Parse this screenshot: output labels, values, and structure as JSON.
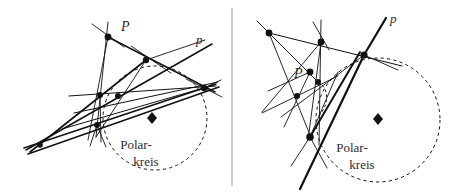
{
  "figure": {
    "background_color": "#ffffff",
    "ink_color": "#111111",
    "text_color": "#2b2b2b",
    "divider_color": "#b4b4b4",
    "width": 457,
    "height": 194,
    "divider": {
      "x": 232,
      "y1": 8,
      "y2": 186
    }
  },
  "panels": [
    {
      "id": "left",
      "name": "left-panel",
      "point_label": "P",
      "line_label": "p",
      "circle_label_line1": "Polar-",
      "circle_label_line2": "kreis",
      "circle": {
        "cx": 155,
        "cy": 118,
        "r": 52,
        "style": "dashed"
      },
      "center_marker": {
        "x": 152,
        "y": 118,
        "shape": "diamond"
      },
      "point_label_pos": {
        "x": 121,
        "y": 31
      },
      "line_label_pos": {
        "x": 196,
        "y": 44
      },
      "circle_label_pos": {
        "x": 136,
        "y": 149
      },
      "nodes": [
        {
          "x": 108,
          "y": 37,
          "r": 3.4
        },
        {
          "x": 146,
          "y": 60,
          "r": 3.2
        },
        {
          "x": 100,
          "y": 95,
          "r": 3.0
        },
        {
          "x": 118,
          "y": 96,
          "r": 3.0
        },
        {
          "x": 97,
          "y": 125,
          "r": 3.0
        },
        {
          "x": 40,
          "y": 145,
          "r": 2.8
        },
        {
          "x": 204,
          "y": 88,
          "r": 3.2
        }
      ],
      "segments": [
        {
          "x1": 92,
          "y1": 24,
          "x2": 124,
          "y2": 47,
          "w": 0.9
        },
        {
          "x1": 108,
          "y1": 22,
          "x2": 96,
          "y2": 137,
          "w": 0.9
        },
        {
          "x1": 108,
          "y1": 37,
          "x2": 215,
          "y2": 92,
          "w": 1.5
        },
        {
          "x1": 108,
          "y1": 37,
          "x2": 88,
          "y2": 140,
          "w": 0.9
        },
        {
          "x1": 131,
          "y1": 46,
          "x2": 171,
          "y2": 73,
          "w": 0.9
        },
        {
          "x1": 146,
          "y1": 60,
          "x2": 205,
          "y2": 40,
          "w": 0.9
        },
        {
          "x1": 146,
          "y1": 60,
          "x2": 30,
          "y2": 152,
          "w": 1.6
        },
        {
          "x1": 146,
          "y1": 60,
          "x2": 96,
          "y2": 137,
          "w": 0.9
        },
        {
          "x1": 26,
          "y1": 150,
          "x2": 212,
          "y2": 44,
          "w": 1.5
        },
        {
          "x1": 24,
          "y1": 148,
          "x2": 216,
          "y2": 84,
          "w": 1.5
        },
        {
          "x1": 28,
          "y1": 154,
          "x2": 219,
          "y2": 87,
          "w": 1.5
        },
        {
          "x1": 69,
          "y1": 96,
          "x2": 216,
          "y2": 86,
          "w": 1.0
        },
        {
          "x1": 74,
          "y1": 113,
          "x2": 218,
          "y2": 82,
          "w": 1.0
        },
        {
          "x1": 62,
          "y1": 129,
          "x2": 214,
          "y2": 85,
          "w": 1.0
        },
        {
          "x1": 204,
          "y1": 88,
          "x2": 186,
          "y2": 79,
          "w": 0.9
        },
        {
          "x1": 204,
          "y1": 88,
          "x2": 221,
          "y2": 80,
          "w": 0.9
        },
        {
          "x1": 204,
          "y1": 88,
          "x2": 222,
          "y2": 97,
          "w": 0.9
        },
        {
          "x1": 97,
          "y1": 125,
          "x2": 106,
          "y2": 147,
          "w": 0.9
        },
        {
          "x1": 97,
          "y1": 125,
          "x2": 90,
          "y2": 146,
          "w": 0.9
        },
        {
          "x1": 100,
          "y1": 95,
          "x2": 101,
          "y2": 142,
          "w": 0.9
        }
      ]
    },
    {
      "id": "right",
      "name": "right-panel",
      "point_label": "P",
      "line_label": "p",
      "circle_label_line1": "Polar-",
      "circle_label_line2": "kreis",
      "circle": {
        "cx": 378,
        "cy": 120,
        "r": 62,
        "style": "dashed"
      },
      "center_marker": {
        "x": 378,
        "y": 119,
        "shape": "diamond"
      },
      "point_label_pos": {
        "x": 294,
        "y": 78
      },
      "line_label_pos": {
        "x": 390,
        "y": 23
      },
      "circle_label_pos": {
        "x": 352,
        "y": 152
      },
      "nodes": [
        {
          "x": 269,
          "y": 33,
          "r": 3.4
        },
        {
          "x": 321,
          "y": 42,
          "r": 3.4
        },
        {
          "x": 364,
          "y": 55,
          "r": 3.6
        },
        {
          "x": 310,
          "y": 72,
          "r": 3.4
        },
        {
          "x": 318,
          "y": 82,
          "r": 3.0
        },
        {
          "x": 297,
          "y": 96,
          "r": 3.0
        },
        {
          "x": 310,
          "y": 137,
          "r": 3.8
        }
      ],
      "segments": [
        {
          "x1": 257,
          "y1": 21,
          "x2": 281,
          "y2": 45,
          "w": 0.9
        },
        {
          "x1": 269,
          "y1": 33,
          "x2": 402,
          "y2": 66,
          "w": 1.0
        },
        {
          "x1": 269,
          "y1": 33,
          "x2": 318,
          "y2": 82,
          "w": 0.9
        },
        {
          "x1": 269,
          "y1": 33,
          "x2": 312,
          "y2": 140,
          "w": 0.9
        },
        {
          "x1": 321,
          "y1": 20,
          "x2": 319,
          "y2": 145,
          "w": 0.9
        },
        {
          "x1": 313,
          "y1": 22,
          "x2": 329,
          "y2": 50,
          "w": 0.9
        },
        {
          "x1": 321,
          "y1": 42,
          "x2": 262,
          "y2": 112,
          "w": 0.9
        },
        {
          "x1": 321,
          "y1": 42,
          "x2": 308,
          "y2": 140,
          "w": 0.9
        },
        {
          "x1": 364,
          "y1": 55,
          "x2": 281,
          "y2": 117,
          "w": 0.9
        },
        {
          "x1": 364,
          "y1": 55,
          "x2": 398,
          "y2": 70,
          "w": 0.9
        },
        {
          "x1": 364,
          "y1": 55,
          "x2": 300,
          "y2": 189,
          "w": 2.2
        },
        {
          "x1": 364,
          "y1": 55,
          "x2": 386,
          "y2": 18,
          "w": 2.2
        },
        {
          "x1": 310,
          "y1": 137,
          "x2": 360,
          "y2": 52,
          "w": 2.0
        },
        {
          "x1": 310,
          "y1": 72,
          "x2": 284,
          "y2": 127,
          "w": 0.9
        },
        {
          "x1": 310,
          "y1": 72,
          "x2": 268,
          "y2": 91,
          "w": 0.9
        },
        {
          "x1": 297,
          "y1": 96,
          "x2": 338,
          "y2": 76,
          "w": 0.9
        },
        {
          "x1": 297,
          "y1": 96,
          "x2": 262,
          "y2": 113,
          "w": 0.9
        },
        {
          "x1": 310,
          "y1": 137,
          "x2": 291,
          "y2": 166,
          "w": 0.9
        },
        {
          "x1": 310,
          "y1": 137,
          "x2": 327,
          "y2": 168,
          "w": 0.9
        },
        {
          "x1": 310,
          "y1": 137,
          "x2": 338,
          "y2": 72,
          "w": 0.9
        }
      ],
      "arc": {
        "d": "M 318 82 C 329 88 330 104 318 117"
      }
    }
  ]
}
